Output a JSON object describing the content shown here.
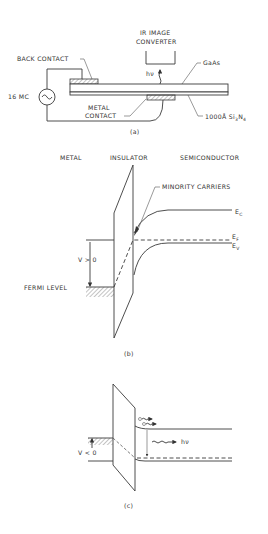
{
  "figure": {
    "panel_a": {
      "caption": "(a)",
      "labels": {
        "converter_line1": "IR IMAGE",
        "converter_line2": "CONVERTER",
        "photon": "hν",
        "gaas": "GaAs",
        "back_contact": "BACK CONTACT",
        "source": "16 MC",
        "metal_contact_line1": "METAL",
        "metal_contact_line2": "CONTACT",
        "insulator_main": "1000Å Si",
        "insulator_sub3": "3",
        "insulator_N": "N",
        "insulator_sub4": "4"
      }
    },
    "panel_b": {
      "caption": "(b)",
      "labels": {
        "metal": "METAL",
        "insulator": "INSULATOR",
        "semiconductor": "SEMICONDUCTOR",
        "minority_carriers": "MINORITY CARRIERS",
        "ec": "E",
        "ec_sub": "C",
        "ef": "E",
        "ef_sub": "F",
        "ev": "E",
        "ev_sub": "V",
        "bias": "V > 0",
        "fermi_level": "FERMI LEVEL"
      }
    },
    "panel_c": {
      "caption": "(c)",
      "labels": {
        "bias": "V < 0",
        "photon": "hν"
      }
    }
  },
  "colors": {
    "ink": "#3a3a3a",
    "background": "#ffffff"
  }
}
